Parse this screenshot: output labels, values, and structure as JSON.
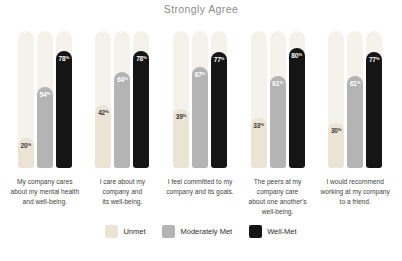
{
  "title": "Strongly Agree",
  "value_suffix": "%",
  "colors": {
    "background": "#ffffff",
    "title_text": "#8b8b8b",
    "track": "#f5f2eb",
    "unmet": "#ebe3d4",
    "moderately_met": "#b4b4b4",
    "well_met": "#151515",
    "label_on_light": "#3a3a3a",
    "label_on_dark": "#ffffff",
    "category_text": "#3f3f3f"
  },
  "chart_data": {
    "type": "bar",
    "title": "Strongly Agree",
    "categories": [
      "My company cares\nabout my mental health\nand well-being.",
      "I care about my\ncompany and\nits well-being.",
      "I feel committed to my\ncompany and its goals.",
      "The peers at my\ncompany care\nabout one another's\nwell-being.",
      "I would recommend\nworking at my company\nto a friend."
    ],
    "series": [
      {
        "name": "Unmet",
        "values": [
          20,
          42,
          39,
          33,
          30
        ]
      },
      {
        "name": "Moderately Met",
        "values": [
          54,
          64,
          67,
          61,
          61
        ]
      },
      {
        "name": "Well-Met",
        "values": [
          78,
          78,
          77,
          80,
          77
        ]
      }
    ],
    "ylim": [
      0,
      91
    ],
    "value_suffix": "%",
    "grid": false,
    "legend_position": "bottom"
  },
  "legend": {
    "items": [
      {
        "label": "Unmet",
        "color": "#ebe3d4"
      },
      {
        "label": "Moderately Met",
        "color": "#b4b4b4"
      },
      {
        "label": "Well-Met",
        "color": "#151515"
      }
    ]
  }
}
